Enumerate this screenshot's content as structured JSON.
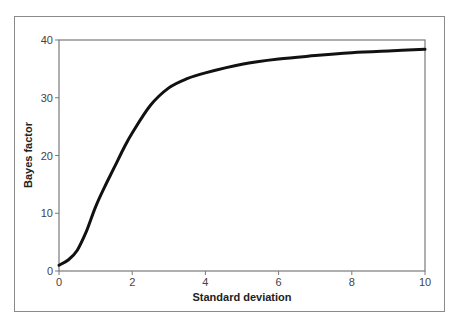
{
  "chart_data": {
    "type": "line",
    "title": "",
    "xlabel": "Standard deviation",
    "ylabel": "Bayes factor",
    "xlim": [
      0,
      10
    ],
    "ylim": [
      0,
      40
    ],
    "xticks": [
      0,
      2,
      4,
      6,
      8,
      10
    ],
    "yticks": [
      0,
      10,
      20,
      30,
      40
    ],
    "grid": false,
    "legend": null,
    "series": [
      {
        "name": "Bayes factor",
        "x": [
          0,
          0.25,
          0.5,
          0.75,
          1.0,
          1.25,
          1.5,
          1.75,
          2.0,
          2.5,
          3.0,
          3.5,
          4.0,
          5.0,
          6.0,
          7.0,
          8.0,
          9.0,
          10.0
        ],
        "values": [
          1.0,
          1.9,
          3.6,
          6.9,
          11.1,
          14.6,
          17.8,
          21.0,
          23.9,
          28.7,
          31.7,
          33.3,
          34.3,
          35.8,
          36.7,
          37.3,
          37.8,
          38.1,
          38.4
        ]
      }
    ]
  }
}
